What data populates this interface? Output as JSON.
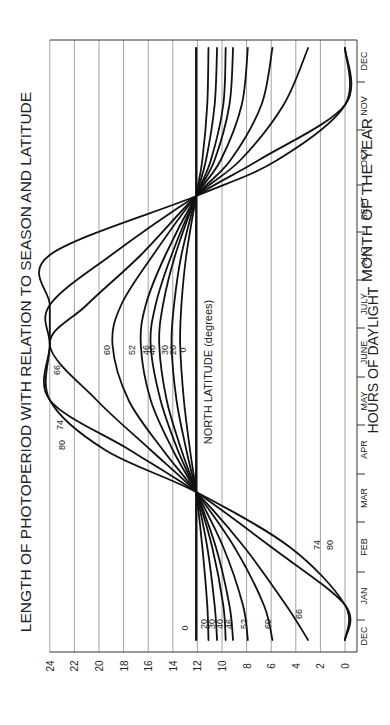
{
  "chart_data": {
    "type": "line",
    "orientation": "rotated-90-ccw",
    "title": "LENGTH OF PHOTOPERIOD WITH RELATION TO SEASON AND LATITUDE",
    "xlabel": "MONTH OF THE YEAR",
    "ylabel": "HOURS OF DAYLIGHT",
    "annotation": "NORTH LATITUDE (degrees)",
    "ylim": [
      0,
      24
    ],
    "yticks": [
      "0",
      "2",
      "4",
      "6",
      "8",
      "10",
      "12",
      "14",
      "16",
      "18",
      "20",
      "22",
      "24"
    ],
    "categories": [
      "DEC",
      "JAN",
      "FEB",
      "MAR",
      "APR",
      "MAY",
      "JUNE",
      "JULY",
      "AUG",
      "SEPT",
      "OCT",
      "NOV",
      "DEC"
    ],
    "grid": true,
    "x_points": [
      "Dec 21",
      "Jan 15",
      "Feb 15",
      "Mar 21",
      "Apr 15",
      "May 15",
      "Jun 21",
      "Jul 15",
      "Aug 15",
      "Sep 22",
      "Oct 15",
      "Nov 15",
      "Dec 21"
    ],
    "series": [
      {
        "name": "0",
        "values": [
          12.1,
          12.1,
          12.1,
          12.1,
          12.1,
          12.1,
          12.1,
          12.1,
          12.1,
          12.1,
          12.1,
          12.1,
          12.1
        ]
      },
      {
        "name": "20",
        "values": [
          11.1,
          11.2,
          11.6,
          12.1,
          12.6,
          13.1,
          13.4,
          13.3,
          12.9,
          12.1,
          11.6,
          11.2,
          11.1
        ]
      },
      {
        "name": "30",
        "values": [
          10.4,
          10.6,
          11.2,
          12.1,
          12.9,
          13.7,
          14.1,
          13.9,
          13.3,
          12.1,
          11.3,
          10.6,
          10.4
        ]
      },
      {
        "name": "40",
        "values": [
          9.7,
          9.9,
          10.8,
          12.1,
          13.3,
          14.5,
          15.1,
          14.8,
          13.8,
          12.1,
          10.9,
          9.9,
          9.7
        ]
      },
      {
        "name": "46",
        "values": [
          9.1,
          9.4,
          10.5,
          12.1,
          13.6,
          15.0,
          15.8,
          15.4,
          14.1,
          12.1,
          10.6,
          9.4,
          9.1
        ]
      },
      {
        "name": "52",
        "values": [
          7.9,
          8.3,
          9.9,
          12.1,
          14.0,
          15.8,
          16.6,
          16.2,
          14.6,
          12.1,
          10.1,
          8.4,
          7.9
        ]
      },
      {
        "name": "60",
        "values": [
          5.9,
          6.6,
          9.0,
          12.1,
          14.8,
          17.6,
          18.9,
          18.2,
          15.6,
          12.1,
          9.3,
          6.8,
          5.9
        ]
      },
      {
        "name": "66",
        "values": [
          3.0,
          4.8,
          8.2,
          12.1,
          15.8,
          20.2,
          24.0,
          21.0,
          16.6,
          12.1,
          8.5,
          5.0,
          3.0
        ]
      },
      {
        "name": "74",
        "values": [
          0,
          0,
          6.0,
          12.1,
          17.5,
          24.0,
          24.0,
          24.0,
          19.0,
          12.1,
          7.0,
          0,
          0
        ]
      },
      {
        "name": "80",
        "values": [
          0,
          0,
          4.5,
          12.1,
          19.5,
          24.0,
          24.0,
          24.0,
          24.0,
          12.1,
          5.5,
          0,
          0
        ]
      }
    ]
  }
}
